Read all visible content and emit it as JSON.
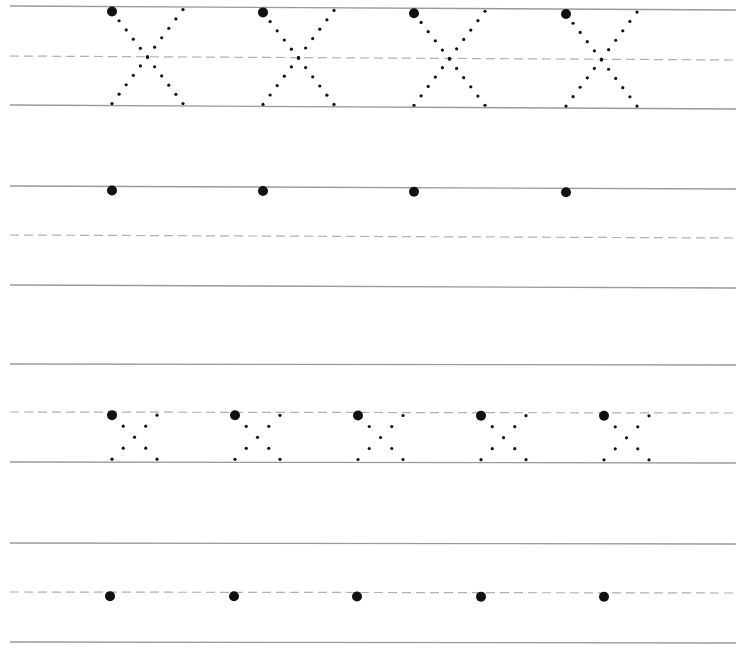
{
  "worksheet": {
    "letter": "X",
    "colors": {
      "solid_line": "#9a9a9a",
      "dashed_line": "#b0b0b0",
      "dot": "#111111"
    },
    "rows": [
      {
        "name": "row-1-large-uppercase",
        "top": 6,
        "mid": 56,
        "base": 105,
        "tilt": 4,
        "type": "large-x",
        "letter_x": [
          112,
          263,
          414,
          566
        ],
        "letter_width": 71
      },
      {
        "name": "row-2-large-practice",
        "top": 186,
        "mid": 235,
        "base": 285,
        "tilt": 3,
        "type": "start-dot",
        "letter_x": [
          112,
          263,
          414,
          566
        ]
      },
      {
        "name": "row-3-small-lowercase",
        "top": 364,
        "mid": 412,
        "base": 462,
        "tilt": 1,
        "type": "small-x",
        "letter_x": [
          112,
          235,
          358,
          481,
          604
        ],
        "letter_width": 45
      },
      {
        "name": "row-4-small-practice",
        "top": 543,
        "mid": 592,
        "base": 642,
        "tilt": 1,
        "type": "start-dot",
        "letter_x": [
          110,
          234,
          357,
          481,
          604
        ]
      }
    ]
  }
}
